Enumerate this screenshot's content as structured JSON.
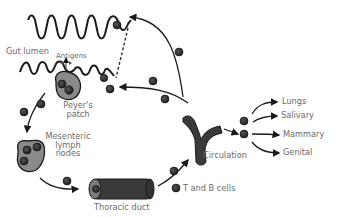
{
  "diagram": {
    "labels": {
      "gut_lumen": "Gut lumen",
      "antigens": "Antigens",
      "peyers_patch_line1": "Peyer's",
      "peyers_patch_line2": "patch",
      "mesenteric_line1": "Mesenteric",
      "mesenteric_line2": "lymph",
      "mesenteric_line3": "nodes",
      "thoracic_duct": "Thoracic duct",
      "t_and_b_cells": "T and B cells",
      "circulation": "Circulation"
    },
    "destinations": [
      "Lungs",
      "Salivary",
      "Mammary",
      "Genital"
    ],
    "colors": {
      "line": "#1a1a1a",
      "cell_fill": "#333333",
      "tissue_fill": "#8a8a8a",
      "vessel_fill": "#3a3a3a",
      "label_text": "#6a6a6a"
    }
  }
}
